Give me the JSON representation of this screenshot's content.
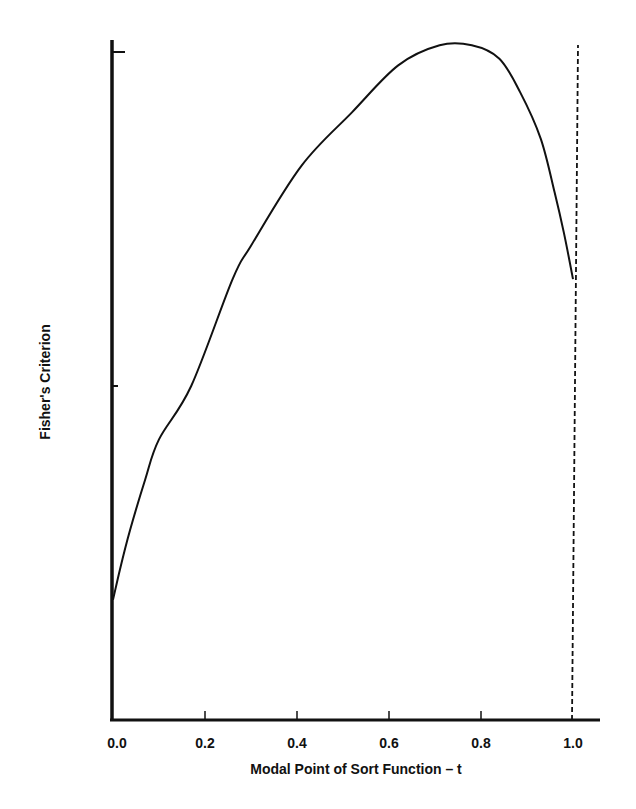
{
  "chart_data": {
    "type": "line",
    "title": "",
    "xlabel": "Modal Point of Sort Function – t",
    "ylabel": "Fisher's Criterion",
    "xlim": [
      0.0,
      1.06
    ],
    "ylim": [
      0.0,
      1.0
    ],
    "grid": false,
    "legend": null,
    "x_ticks": [
      "0.0",
      "0.2",
      "0.4",
      "0.6",
      "0.8",
      "1.0"
    ],
    "x_tick_values": [
      0.0,
      0.2,
      0.4,
      0.6,
      0.8,
      1.0
    ],
    "y_ticks_unlabeled": [
      0.5,
      1.0
    ],
    "y_scale_note": "y-axis unlabeled; values normalized so top tick = 1.0",
    "series": [
      {
        "name": "Fisher's Criterion",
        "style": "solid",
        "x": [
          0.0,
          0.015,
          0.037,
          0.07,
          0.1,
          0.17,
          0.26,
          0.3,
          0.41,
          0.52,
          0.62,
          0.71,
          0.78,
          0.84,
          0.885,
          0.93,
          0.96,
          0.98,
          1.0
        ],
        "y": [
          0.18,
          0.225,
          0.284,
          0.36,
          0.42,
          0.5,
          0.66,
          0.71,
          0.83,
          0.91,
          0.98,
          1.01,
          1.01,
          0.99,
          0.94,
          0.87,
          0.79,
          0.73,
          0.66
        ]
      }
    ],
    "annotations": [
      {
        "type": "vertical-dashed-line",
        "x": 1.0,
        "y_from": 0.0,
        "y_to": 1.01
      }
    ]
  }
}
